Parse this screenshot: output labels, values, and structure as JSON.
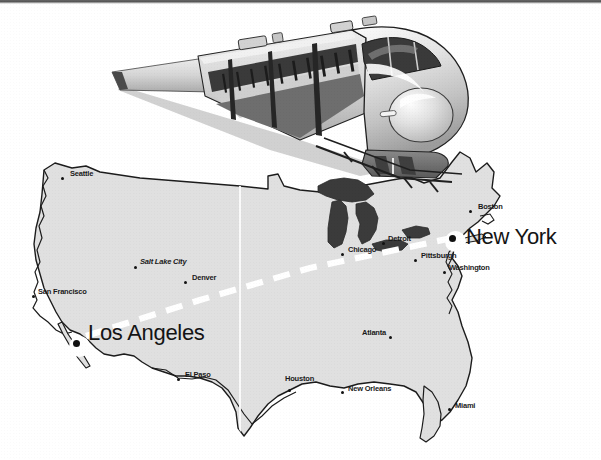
{
  "figure": {
    "kind": "illustration-map",
    "background_color": "#ffffff"
  },
  "train": {
    "name": "high-speed-bullet-train",
    "description": "Shinkansen-style bullet train in sharp left-receding perspective",
    "body_color": "#d9d9d9",
    "shadow_color": "#8f8f8f",
    "window_color": "#3a3a3a",
    "outline_color": "#1e1e1e"
  },
  "map": {
    "name": "united-states-map",
    "land_fill": "#e0e0e0",
    "outline_color": "#1c1c1c",
    "lakes_fill": "#3b3b3b",
    "seam_line_color": "#fbfbfb"
  },
  "route": {
    "name": "los-angeles-to-new-york-route",
    "style": "dashed",
    "color": "#ffffff",
    "width_px": 6,
    "origin": "Los Angeles",
    "destination": "New York"
  },
  "cities": [
    {
      "name": "Seattle",
      "label": "Seattle",
      "style": "small",
      "dot": "small",
      "label_x": 70,
      "label_y": 174,
      "dot_x": 62,
      "dot_y": 178,
      "dot_side": "left"
    },
    {
      "name": "San Francisco",
      "label": "San Francisco",
      "style": "small",
      "dot": "small",
      "label_x": 38,
      "label_y": 292,
      "dot_x": 33,
      "dot_y": 296,
      "dot_side": "left"
    },
    {
      "name": "Salt Lake City",
      "label": "Salt Lake City",
      "style": "italic",
      "dot": "small",
      "label_x": 140,
      "label_y": 262,
      "dot_x": 135,
      "dot_y": 267,
      "dot_side": "left"
    },
    {
      "name": "Denver",
      "label": "Denver",
      "style": "small",
      "dot": "small",
      "label_x": 192,
      "label_y": 278,
      "dot_x": 185,
      "dot_y": 282,
      "dot_side": "left"
    },
    {
      "name": "Los Angeles",
      "label": "Los Angeles",
      "style": "large",
      "dot": "large",
      "label_x": 88,
      "label_y": 334,
      "dot_x": 76,
      "dot_y": 343,
      "dot_side": "left"
    },
    {
      "name": "El Paso",
      "label": "El Paso",
      "style": "small",
      "dot": "small",
      "label_x": 185,
      "label_y": 375,
      "dot_x": 178,
      "dot_y": 379,
      "dot_side": "left"
    },
    {
      "name": "Houston",
      "label": "Houston",
      "style": "small",
      "dot": "small",
      "label_x": 285,
      "label_y": 379,
      "dot_x": 289,
      "dot_y": 390,
      "dot_side": "left"
    },
    {
      "name": "New Orleans",
      "label": "New Orleans",
      "style": "small",
      "dot": "small",
      "label_x": 348,
      "label_y": 389,
      "dot_x": 342,
      "dot_y": 392,
      "dot_side": "left"
    },
    {
      "name": "Chicago",
      "label": "Chicago",
      "style": "small",
      "dot": "small",
      "label_x": 348,
      "label_y": 250,
      "dot_x": 342,
      "dot_y": 254,
      "dot_side": "left"
    },
    {
      "name": "Detroit",
      "label": "Detroit",
      "style": "small",
      "dot": "small",
      "label_x": 388,
      "label_y": 239,
      "dot_x": 383,
      "dot_y": 243,
      "dot_side": "left"
    },
    {
      "name": "Pittsburgh",
      "label": "Pittsburgh",
      "style": "small",
      "dot": "small",
      "label_x": 421,
      "label_y": 256,
      "dot_x": 415,
      "dot_y": 260,
      "dot_side": "left"
    },
    {
      "name": "Washington",
      "label": "Washington",
      "style": "small",
      "dot": "small",
      "label_x": 449,
      "label_y": 268,
      "dot_x": 444,
      "dot_y": 272,
      "dot_side": "left"
    },
    {
      "name": "Boston",
      "label": "Boston",
      "style": "small",
      "dot": "small",
      "label_x": 478,
      "label_y": 207,
      "dot_x": 470,
      "dot_y": 211,
      "dot_side": "left"
    },
    {
      "name": "New York",
      "label": "New York",
      "style": "large",
      "dot": "large",
      "label_x": 466,
      "label_y": 238,
      "dot_x": 452,
      "dot_y": 238,
      "dot_side": "left"
    },
    {
      "name": "Atlanta",
      "label": "Atlanta",
      "style": "small",
      "dot": "small",
      "label_x": 362,
      "label_y": 333,
      "dot_x": 390,
      "dot_y": 337,
      "dot_side": "right"
    },
    {
      "name": "Miami",
      "label": "Miami",
      "style": "small",
      "dot": "small",
      "label_x": 455,
      "label_y": 406,
      "dot_x": 449,
      "dot_y": 409,
      "dot_side": "left"
    }
  ]
}
